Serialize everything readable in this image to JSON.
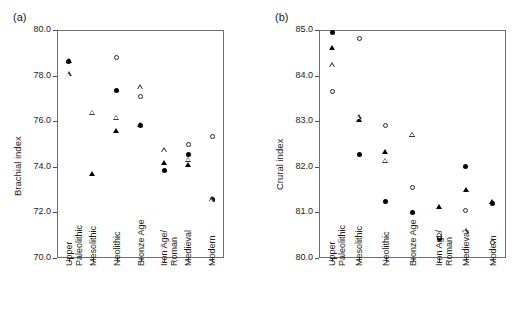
{
  "figure": {
    "panels": [
      {
        "id": "a",
        "label": "(a)",
        "ylabel": "Brachial index"
      },
      {
        "id": "b",
        "label": "(b)",
        "ylabel": "Crural index"
      }
    ]
  },
  "chart_data": [
    {
      "type": "scatter",
      "title": "(a)",
      "xlabel": "",
      "ylabel": "Brachial index",
      "ylim": [
        70.0,
        80.0
      ],
      "yticks": [
        70.0,
        72.0,
        74.0,
        76.0,
        78.0,
        80.0
      ],
      "ytick_labels": [
        "70.0",
        "72.0",
        "74.0",
        "76.0",
        "78.0",
        "80.0"
      ],
      "grid": false,
      "legend": "none",
      "categories": [
        "Upper Paleolithic",
        "Mesolithic",
        "Neolithic",
        "Bronze Age",
        "Iron Age/ Roman",
        "Medieval",
        "Modern"
      ],
      "series": [
        {
          "name": "filled-circle",
          "marker": "filled-circle",
          "values": [
            78.6,
            null,
            77.35,
            75.8,
            73.85,
            74.55,
            72.55
          ]
        },
        {
          "name": "filled-triangle",
          "marker": "filled-triangle",
          "values": [
            78.62,
            73.7,
            75.55,
            75.85,
            74.15,
            74.1,
            72.6
          ]
        },
        {
          "name": "open-circle",
          "marker": "open-circle",
          "values": [
            null,
            null,
            78.8,
            77.1,
            null,
            75.0,
            75.35
          ]
        },
        {
          "name": "open-triangle",
          "marker": "open-triangle",
          "values": [
            78.05,
            76.6,
            76.6,
            78.15,
            75.6,
            75.4,
            73.85
          ]
        }
      ]
    },
    {
      "type": "scatter",
      "title": "(b)",
      "xlabel": "",
      "ylabel": "Crural index",
      "ylim": [
        80.0,
        85.0
      ],
      "yticks": [
        80.0,
        81.0,
        82.0,
        83.0,
        84.0,
        85.0
      ],
      "ytick_labels": [
        "80.0",
        "81.0",
        "82.0",
        "83.0",
        "84.0",
        "85.0"
      ],
      "grid": false,
      "legend": "none",
      "categories": [
        "Upper Paleolithic",
        "Mesolithic",
        "Neolithic",
        "Bronze Age",
        "Iron Age/ Roman",
        "Medieval",
        "Modern"
      ],
      "series": [
        {
          "name": "filled-circle",
          "marker": "filled-circle",
          "values": [
            84.95,
            82.27,
            81.25,
            81.0,
            80.42,
            82.0,
            81.2
          ]
        },
        {
          "name": "filled-triangle",
          "marker": "filled-triangle",
          "values": [
            84.6,
            83.02,
            82.32,
            82.7,
            81.12,
            81.5,
            81.22
          ]
        },
        {
          "name": "open-circle",
          "marker": "open-circle",
          "values": [
            83.65,
            84.82,
            82.9,
            81.55,
            80.47,
            81.05,
            80.33
          ]
        },
        {
          "name": "open-triangle",
          "marker": "open-triangle",
          "values": [
            84.23,
            83.2,
            82.35,
            83.03,
            80.95,
            81.13,
            null
          ]
        }
      ]
    }
  ]
}
